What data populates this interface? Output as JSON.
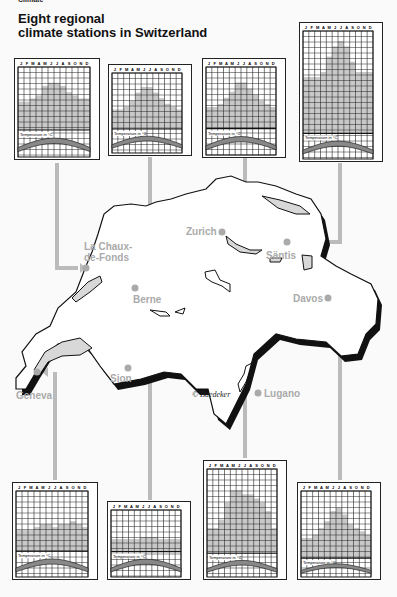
{
  "header": {
    "kicker": "Climate",
    "title_line1": "Eight regional",
    "title_line2": "climate stations in Switzerland"
  },
  "stations": [
    {
      "name": "La Chaux-de-Fonds",
      "line1": "La Chaux-",
      "line2": "de-Fonds"
    },
    {
      "name": "Berne"
    },
    {
      "name": "Zurich"
    },
    {
      "name": "Säntis"
    },
    {
      "name": "Davos"
    },
    {
      "name": "Geneva"
    },
    {
      "name": "Sion"
    },
    {
      "name": "Lugano"
    }
  ],
  "copyright": "© Baedeker",
  "chart_common": {
    "months": [
      "J",
      "F",
      "M",
      "A",
      "M",
      "J",
      "J",
      "A",
      "S",
      "O",
      "N",
      "D"
    ],
    "precip_label": "Precipitation in mm",
    "temp_label": "Temperature in °C",
    "max_label": "max.",
    "min_label": "min."
  },
  "colors": {
    "land": "#ffffff",
    "border": "#111111",
    "shadow": "#111111",
    "lake": "#d8d8d8",
    "leader_line": "#bbbbbb",
    "label": "#aaaaaa",
    "precip_fill": "#c8c8c8"
  }
}
